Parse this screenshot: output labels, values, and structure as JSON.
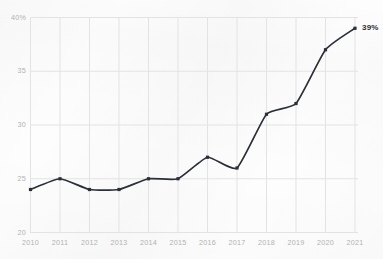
{
  "chart_data": {
    "type": "line",
    "title": "",
    "subtitle": "",
    "xlabel": "",
    "ylabel": "",
    "categories": [
      "2010",
      "2011",
      "2012",
      "2013",
      "2014",
      "2015",
      "2016",
      "2017",
      "2018",
      "2019",
      "2020",
      "2021"
    ],
    "x": [
      2010,
      2011,
      2012,
      2013,
      2014,
      2015,
      2016,
      2017,
      2018,
      2019,
      2020,
      2021
    ],
    "values": [
      24,
      25,
      24,
      24,
      25,
      25,
      27,
      26,
      31,
      32,
      37,
      39
    ],
    "series": [
      {
        "name": "",
        "values": [
          24,
          25,
          24,
          24,
          25,
          25,
          27,
          26,
          31,
          32,
          37,
          39
        ]
      }
    ],
    "ylim": [
      20,
      40
    ],
    "xlim": [
      2010,
      2021
    ],
    "ytick_labels": [
      "40%",
      "35",
      "30",
      "25",
      "20"
    ],
    "ytick_values": [
      40,
      35,
      30,
      25,
      20
    ],
    "xtick_labels": [
      "2010",
      "2011",
      "2012",
      "2013",
      "2014",
      "2015",
      "2016",
      "2017",
      "2018",
      "2019",
      "2020",
      "2021"
    ],
    "annotations": [
      {
        "text": "39%",
        "x": 2021,
        "y": 39
      }
    ],
    "legend": [],
    "legend_position": "none",
    "grid": true,
    "grid_x": true,
    "grid_y": true,
    "marker": "square",
    "colors": {
      "line": "#2b2f38",
      "marker": "#2b2f38",
      "grid": "#e3e3e3",
      "axis_text": "#b2b2b2",
      "annotation_text": "#2b2f38",
      "background": "#fdfdfd"
    }
  }
}
